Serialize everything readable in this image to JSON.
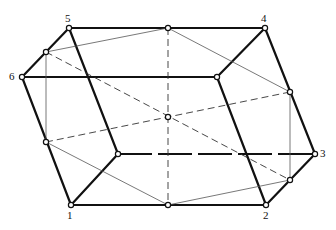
{
  "diagram": {
    "type": "rhombohedral-cell",
    "vertices": [
      {
        "id": "1",
        "label": "1",
        "x": 71,
        "y": 205
      },
      {
        "id": "2",
        "label": "2",
        "x": 266,
        "y": 205
      },
      {
        "id": "3",
        "label": "3",
        "x": 315,
        "y": 154
      },
      {
        "id": "4",
        "label": "4",
        "x": 265,
        "y": 28
      },
      {
        "id": "5",
        "label": "5",
        "x": 69,
        "y": 28
      },
      {
        "id": "6",
        "label": "6",
        "x": 22,
        "y": 77
      }
    ],
    "labels": {
      "v1": "1",
      "v2": "2",
      "v3": "3",
      "v4": "4",
      "v5": "5",
      "v6": "6"
    }
  }
}
